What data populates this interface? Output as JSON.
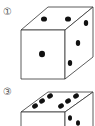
{
  "figures": [
    {
      "label": "①",
      "faces": {
        "top": 2,
        "front": 1,
        "right": 3
      }
    },
    {
      "label": "③",
      "faces": {
        "top": 6,
        "right": "partial"
      }
    }
  ],
  "colors": {
    "line": "#333333",
    "dot": "#111111",
    "label": "#555555"
  }
}
